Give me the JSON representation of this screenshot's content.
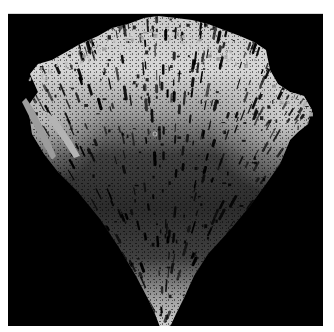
{
  "image": {
    "subject": "dendritic-aggregate-cone",
    "description": "Grayscale render of a branching fractal (DLA-like) cluster growing upward from a single point into a cone/fan shape on a black background",
    "colors": {
      "page_background": "#ffffff",
      "panel_background": "#000000",
      "panel_border": "#d8d8d8",
      "highlight": "#e6e6e6",
      "midtone": "#8a8a8a",
      "shadow": "#2a2a2a"
    },
    "panel": {
      "x": 8,
      "y": 13,
      "width": 315,
      "height": 313
    },
    "origin_point": {
      "x": 160,
      "y": 326
    },
    "seed_marker": {
      "x": 155,
      "y": 133,
      "radius": 2
    },
    "silhouette": {
      "top_left_extent": {
        "x": 28,
        "y": 62
      },
      "top_right_extent": {
        "x": 312,
        "y": 104
      },
      "top_edge_y": 14,
      "apex": {
        "x": 160,
        "y": 326
      }
    }
  }
}
